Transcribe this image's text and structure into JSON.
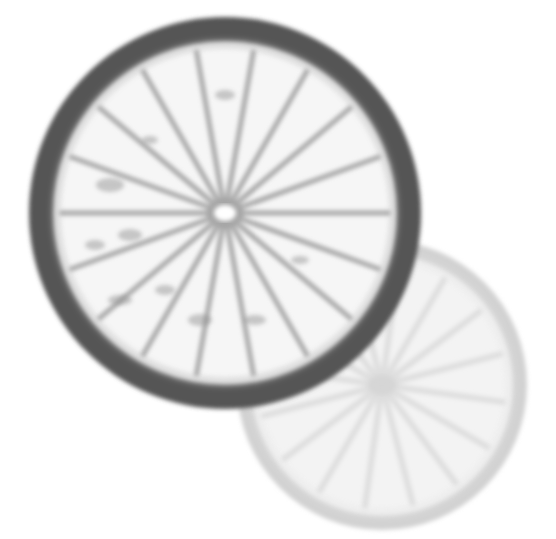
{
  "image": {
    "width": 556,
    "height": 539,
    "background": "#ffffff",
    "description": "Grayscale backlit photograph of two citrus (lime/lemon) slices; a dark-rinded slice in front at upper-left overlapping a pale, faded slice behind at lower-right."
  },
  "slices": [
    {
      "name": "back-citrus-slice",
      "cx": 382,
      "cy": 385,
      "r": 145,
      "rind_color": "#d2d2d2",
      "rind_width": 16,
      "flesh_color": "#f3f3f3",
      "membrane_color": "#dcdcdc",
      "center_color": "#d6d6d6",
      "segments": 16,
      "rotation": 8
    },
    {
      "name": "front-citrus-slice",
      "cx": 225,
      "cy": 213,
      "r": 196,
      "rind_color": "#555555",
      "rind_width": 26,
      "flesh_color": "#f6f6f6",
      "membrane_color": "#9a9a9a",
      "center_color": "#ffffff",
      "segments": 18,
      "rotation": 0
    }
  ]
}
